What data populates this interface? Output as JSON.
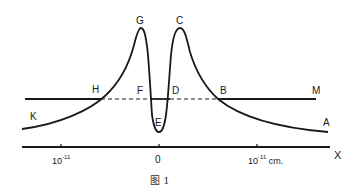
{
  "diagram": {
    "caption": "图 1",
    "axis_label": "X",
    "ticks": [
      {
        "base": "10",
        "exp": "-11",
        "unit": ""
      },
      {
        "base": "0",
        "exp": "",
        "unit": ""
      },
      {
        "base": "10",
        "exp": "-11",
        "unit": " cm."
      }
    ],
    "point_labels": {
      "G": "G",
      "C": "C",
      "H": "H",
      "F": "F",
      "D": "D",
      "B": "B",
      "M": "M",
      "K": "K",
      "E": "E",
      "A": "A"
    },
    "line_color": "#1a1a1a"
  }
}
